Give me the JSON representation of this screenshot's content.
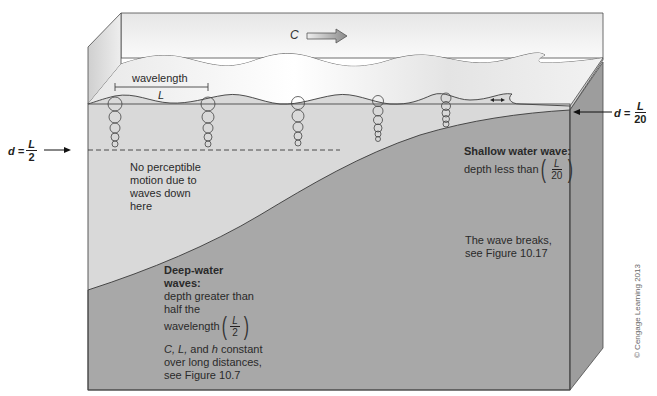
{
  "figure": {
    "colors": {
      "water": "#d8d8d8",
      "water_light": "#eeeeee",
      "seafloor": "#a6a6a6",
      "box_side": "#9a9a9a",
      "outline": "#4a4a4a",
      "background": "#ffffff"
    }
  },
  "labels": {
    "celerity": "C",
    "wavelength": "wavelength",
    "wavelength_symbol": "L",
    "deep_limit": {
      "lhs": "d =",
      "numerator": "L",
      "denominator": "2"
    },
    "shallow_limit": {
      "lhs": "d =",
      "numerator": "L",
      "denominator": "20"
    },
    "no_motion": [
      "No perceptible",
      "motion due to",
      "waves down",
      "here"
    ],
    "shallow_title": "Shallow water wave:",
    "shallow_desc": "depth less than",
    "shallow_frac": {
      "numerator": "L",
      "denominator": "20"
    },
    "breaks": [
      "The wave breaks,",
      "see Figure 10.17"
    ],
    "deep_title": [
      "Deep-water",
      "waves:"
    ],
    "deep_desc": [
      "depth greater than",
      "half the",
      "wavelength"
    ],
    "deep_frac": {
      "numerator": "L",
      "denominator": "2"
    },
    "deep_constant": {
      "symbols": "C, L,",
      "and": " and ",
      "h": "h",
      "rest": " constant",
      "line2": "over long distances,",
      "line3": "see Figure 10.7"
    },
    "copyright": "© Cengage Learning 2013"
  }
}
